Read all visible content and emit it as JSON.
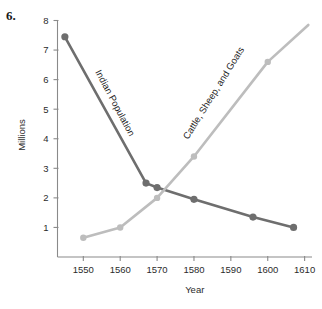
{
  "figure": {
    "number_label": "6."
  },
  "chart_data": {
    "type": "line",
    "title": "",
    "xlabel": "Year",
    "ylabel": "Millions",
    "xlim": [
      1543,
      1612
    ],
    "ylim": [
      0,
      8
    ],
    "xticks": [
      1550,
      1560,
      1570,
      1580,
      1590,
      1600,
      1610
    ],
    "xtick_labels": [
      "1550",
      "1560",
      "1570",
      "1580",
      "1590",
      "1600",
      "1610"
    ],
    "yticks": [
      1,
      2,
      3,
      4,
      5,
      6,
      7,
      8
    ],
    "ytick_labels": [
      "1",
      "2",
      "3",
      "4",
      "5",
      "6",
      "7",
      "8"
    ],
    "grid": false,
    "legend": "inline-labels",
    "series": [
      {
        "name": "Indian Population",
        "color": "#6e6e6e",
        "label_text": "Indian Population",
        "points": [
          {
            "x": 1545,
            "y": 7.45
          },
          {
            "x": 1567,
            "y": 2.5
          },
          {
            "x": 1570,
            "y": 2.35
          },
          {
            "x": 1580,
            "y": 1.95
          },
          {
            "x": 1596,
            "y": 1.35
          },
          {
            "x": 1607,
            "y": 1.0
          }
        ]
      },
      {
        "name": "Cattle, Sheep, and Goats",
        "color": "#bdbdbd",
        "label_text": "Cattle, Sheep, and Goats",
        "points": [
          {
            "x": 1550,
            "y": 0.65
          },
          {
            "x": 1560,
            "y": 1.0
          },
          {
            "x": 1570,
            "y": 2.0
          },
          {
            "x": 1580,
            "y": 3.4
          },
          {
            "x": 1600,
            "y": 6.6
          },
          {
            "x": 1611,
            "y": 7.85
          }
        ]
      }
    ]
  },
  "colors": {
    "dark_series": "#6e6e6e",
    "light_series": "#bdbdbd",
    "axis": "#8a8a8a",
    "text": "#2b2b2b",
    "background": "#ffffff"
  }
}
